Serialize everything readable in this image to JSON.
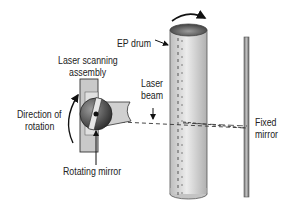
{
  "diagram": {
    "labels": {
      "ep_drum": "EP drum",
      "laser_scanning_assembly_line1": "Laser scanning",
      "laser_scanning_assembly_line2": "assembly",
      "laser_beam_line1": "Laser",
      "laser_beam_line2": "beam",
      "direction_line1": "Direction of",
      "direction_line2": "rotation",
      "rotating_mirror": "Rotating mirror",
      "fixed_mirror_line1": "Fixed",
      "fixed_mirror_line2": "mirror"
    },
    "colors": {
      "drum_body": "#d9d9d9",
      "drum_top": "#6e6e6e",
      "mirror": "#9a9a9a",
      "assembly": "#c8c8c8",
      "sphere": "#555555",
      "text": "#222222"
    }
  }
}
